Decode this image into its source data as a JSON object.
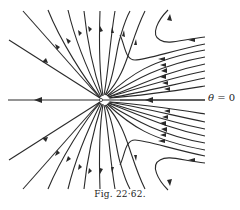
{
  "figure": {
    "caption": "Fig. 22·62.",
    "axis_label": {
      "symbol": "θ",
      "relation": " = ",
      "value": "0"
    },
    "stroke_color": "#2a2a2a",
    "background": "#ffffff"
  }
}
